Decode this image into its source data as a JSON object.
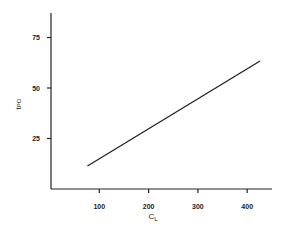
{
  "chart_data": {
    "type": "line",
    "title": "",
    "xlabel": "C",
    "xlabel_sub": "L",
    "ylabel": "t",
    "ylabel_sub": "PO",
    "xlim": [
      0,
      450
    ],
    "ylim": [
      0,
      87
    ],
    "xticks": [
      100,
      200,
      300,
      400
    ],
    "yticks": [
      25,
      50,
      75
    ],
    "xtick_labels": [
      "100",
      "200",
      "300",
      "400"
    ],
    "ytick_labels": [
      "25",
      "50",
      "75"
    ],
    "grid": false,
    "legend": null,
    "series": [
      {
        "name": "tPO vs CL",
        "x": [
          76,
          426
        ],
        "values": [
          11.4,
          63.4
        ]
      }
    ]
  }
}
